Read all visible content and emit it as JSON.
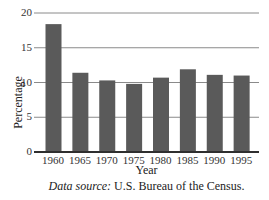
{
  "chart_data": {
    "type": "bar",
    "title": "",
    "xlabel": "Year",
    "ylabel": "Percentage",
    "categories": [
      "1960",
      "1965",
      "1970",
      "1975",
      "1980",
      "1985",
      "1990",
      "1995"
    ],
    "values": [
      18.4,
      11.4,
      10.3,
      9.8,
      10.7,
      11.9,
      11.1,
      11.0
    ],
    "ylim": [
      0,
      20
    ],
    "yticks": [
      0,
      5,
      10,
      15,
      20
    ],
    "grid": true,
    "bar_color": "#5a5a5a",
    "grid_color": "#8a8a8a",
    "legend": null
  },
  "caption": {
    "source_label": "Data source:",
    "source_text": "U.S. Bureau of the Census."
  }
}
